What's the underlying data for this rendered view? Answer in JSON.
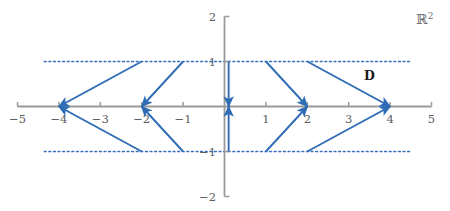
{
  "figure": {
    "space_label": "R",
    "space_label_exponent": "2",
    "region_label": "D",
    "accent_color": "#2e6cb5",
    "axis_color": "#9a9a9a",
    "dotted_color": "#3a6fbf"
  },
  "axes": {
    "x": {
      "min": -5,
      "max": 5,
      "ticks": [
        -5,
        -4,
        -3,
        -2,
        -1,
        1,
        2,
        3,
        4,
        5
      ],
      "tick_labels": [
        "−5",
        "−4",
        "−3",
        "−2",
        "−1",
        "1",
        "2",
        "3",
        "4",
        "5"
      ]
    },
    "y": {
      "min": -2,
      "max": 2,
      "ticks": [
        2,
        1,
        -1,
        -2
      ],
      "tick_labels": [
        "2",
        "1",
        "−1",
        "−2"
      ]
    }
  },
  "chart_data": {
    "type": "line",
    "title": "",
    "xlabel": "",
    "ylabel": "",
    "xlim": [
      -5,
      5
    ],
    "ylim": [
      -2,
      2
    ],
    "grid": false,
    "legend": null,
    "annotations": [
      {
        "text": "R²",
        "x": 4.6,
        "y": 1.85
      },
      {
        "text": "D",
        "x": 3.35,
        "y": 0.62
      }
    ],
    "dotted_lines": [
      {
        "y": 1,
        "x_start": -4.35,
        "x_end": 4.5
      },
      {
        "y": -1,
        "x_start": -4.35,
        "x_end": 4.5
      }
    ],
    "equilibria": [
      -4,
      -2,
      2,
      4
    ],
    "series": [
      {
        "name": "arrow-left-outer-upper",
        "x": [
          -2,
          -4
        ],
        "y": [
          1,
          0
        ],
        "arrow_at_end": true
      },
      {
        "name": "arrow-left-outer-lower",
        "x": [
          -2,
          -4
        ],
        "y": [
          -1,
          0
        ],
        "arrow_at_end": true
      },
      {
        "name": "arrow-left-inner-upper",
        "x": [
          -1,
          -2
        ],
        "y": [
          1,
          0
        ],
        "arrow_at_end": true
      },
      {
        "name": "arrow-left-inner-lower",
        "x": [
          -1,
          -2
        ],
        "y": [
          -1,
          0
        ],
        "arrow_at_end": true
      },
      {
        "name": "arrow-center-upper",
        "x": [
          0.1,
          0.1
        ],
        "y": [
          1,
          0
        ],
        "arrow_at_end": true
      },
      {
        "name": "arrow-center-lower",
        "x": [
          0.1,
          0.1
        ],
        "y": [
          -1,
          0
        ],
        "arrow_at_end": true
      },
      {
        "name": "arrow-right-inner-upper",
        "x": [
          1,
          2
        ],
        "y": [
          1,
          0
        ],
        "arrow_at_end": true
      },
      {
        "name": "arrow-right-inner-lower",
        "x": [
          1,
          2
        ],
        "y": [
          -1,
          0
        ],
        "arrow_at_end": true
      },
      {
        "name": "arrow-right-outer-upper",
        "x": [
          2,
          4
        ],
        "y": [
          1,
          0
        ],
        "arrow_at_end": true
      },
      {
        "name": "arrow-right-outer-lower",
        "x": [
          2,
          4
        ],
        "y": [
          -1,
          0
        ],
        "arrow_at_end": true
      }
    ]
  }
}
